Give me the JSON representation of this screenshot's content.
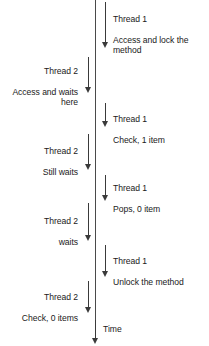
{
  "diagram": {
    "time_axis_label": "Time",
    "line_color": "#3a3a3a",
    "text_color": "#1a1a1a",
    "background": "#ffffff"
  },
  "events": [
    {
      "id": "t1-access-lock",
      "thread": "Thread 1",
      "action": "Access and lock the\nmethod",
      "side": "right"
    },
    {
      "id": "t2-access-waits",
      "thread": "Thread 2",
      "action": "Access and waits\nhere",
      "side": "left"
    },
    {
      "id": "t1-check-1-item",
      "thread": "Thread 1",
      "action": "Check, 1 item",
      "side": "right"
    },
    {
      "id": "t2-still-waits",
      "thread": "Thread 2",
      "action": "Still waits",
      "side": "left"
    },
    {
      "id": "t1-pops-0-item",
      "thread": "Thread 1",
      "action": "Pops, 0 item",
      "side": "right"
    },
    {
      "id": "t2-waits",
      "thread": "Thread 2",
      "action": "waits",
      "side": "left"
    },
    {
      "id": "t1-unlock",
      "thread": "Thread 1",
      "action": "Unlock the method",
      "side": "right"
    },
    {
      "id": "t2-check-0-items",
      "thread": "Thread 2",
      "action": "Check, 0 items",
      "side": "left"
    }
  ]
}
